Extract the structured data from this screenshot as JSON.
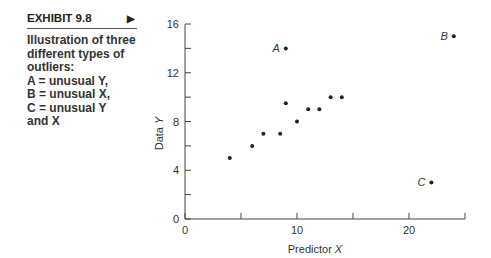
{
  "exhibit": {
    "label": "EXHIBIT 9.8",
    "arrow_icon": "right-triangle-icon",
    "caption_lines": [
      "Illustration of three",
      "different types of",
      "outliers:",
      "A = unusual Y,",
      "B = unusual X,",
      "C = unusual Y",
      "and X"
    ]
  },
  "chart_data": {
    "type": "scatter",
    "title": "",
    "xlabel": "Predictor X",
    "ylabel": "Data Y",
    "xlim": [
      0,
      25
    ],
    "ylim": [
      0,
      16
    ],
    "x_ticks": [
      0,
      5,
      10,
      15,
      20,
      25
    ],
    "x_tick_labels": [
      "0",
      "",
      "10",
      "",
      "20",
      ""
    ],
    "y_ticks": [
      0,
      2,
      4,
      6,
      8,
      10,
      12,
      14,
      16
    ],
    "y_tick_labels": [
      "0",
      "",
      "4",
      "",
      "8",
      "",
      "12",
      "",
      "16"
    ],
    "grid": false,
    "series": [
      {
        "name": "main",
        "points": [
          {
            "x": 4,
            "y": 5
          },
          {
            "x": 6,
            "y": 6
          },
          {
            "x": 7,
            "y": 7
          },
          {
            "x": 8.5,
            "y": 7
          },
          {
            "x": 9,
            "y": 9.5
          },
          {
            "x": 10,
            "y": 8
          },
          {
            "x": 11,
            "y": 9
          },
          {
            "x": 12,
            "y": 9
          },
          {
            "x": 13,
            "y": 10
          },
          {
            "x": 14,
            "y": 10
          }
        ]
      },
      {
        "name": "outliers",
        "points": [
          {
            "x": 9,
            "y": 14,
            "label": "A"
          },
          {
            "x": 24,
            "y": 15,
            "label": "B"
          },
          {
            "x": 22,
            "y": 3,
            "label": "C"
          }
        ]
      }
    ]
  }
}
